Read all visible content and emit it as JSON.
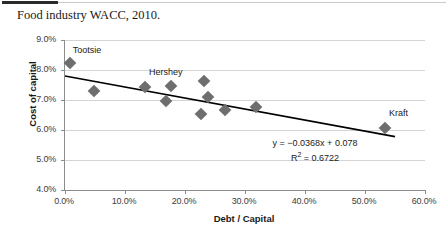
{
  "caption": "Food industry WACC, 2010.",
  "chart_data": {
    "type": "scatter",
    "title": "Food industry WACC, 2010.",
    "xlabel": "Debt / Capital",
    "ylabel": "Cost of capital",
    "xlim": [
      0.0,
      60.0
    ],
    "ylim": [
      4.0,
      9.0
    ],
    "x_ticks": [
      "0.0%",
      "10.0%",
      "20.0%",
      "30.0%",
      "40.0%",
      "50.0%",
      "60.0%"
    ],
    "y_ticks": [
      "4.0%",
      "5.0%",
      "6.0%",
      "7.0%",
      "8.0%",
      "9.0%"
    ],
    "grid": "horizontal",
    "legend": "none",
    "marker_color": "#6e6e6e",
    "trendline_color": "#000000",
    "points": [
      {
        "x": 0.8,
        "y": 8.25,
        "label": "Tootsie"
      },
      {
        "x": 4.9,
        "y": 7.3,
        "label": ""
      },
      {
        "x": 13.4,
        "y": 7.43,
        "label": "Hershey"
      },
      {
        "x": 16.8,
        "y": 6.97,
        "label": ""
      },
      {
        "x": 17.6,
        "y": 7.48,
        "label": ""
      },
      {
        "x": 22.7,
        "y": 6.52,
        "label": ""
      },
      {
        "x": 23.1,
        "y": 7.65,
        "label": ""
      },
      {
        "x": 23.9,
        "y": 7.1,
        "label": ""
      },
      {
        "x": 26.7,
        "y": 6.67,
        "label": ""
      },
      {
        "x": 31.8,
        "y": 6.78,
        "label": ""
      },
      {
        "x": 53.3,
        "y": 6.06,
        "label": "Kraft"
      }
    ],
    "trendline": {
      "slope": -0.0368,
      "intercept": 0.078,
      "equation": "y = −0.0368x + 0.078",
      "r_squared_label": "R",
      "r_squared_exponent": "2",
      "r_squared_value": " = 0.6722",
      "r_squared": 0.6722,
      "x_start": 0.0,
      "y_start": 7.8,
      "x_end": 55.0,
      "y_end": 5.78
    },
    "annotations": [
      {
        "text": "Tootsie",
        "x": 1.3,
        "y": 8.63
      },
      {
        "text": "Hershey",
        "x": 14.0,
        "y": 7.9
      },
      {
        "text": "Kraft",
        "x": 54.0,
        "y": 6.55
      }
    ]
  }
}
